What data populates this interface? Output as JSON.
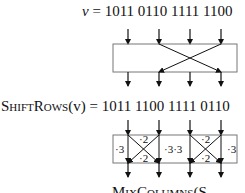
{
  "input": {
    "var": "v",
    "eq": " = ",
    "value": "1011 0110 1111 1100"
  },
  "shiftrows": {
    "func": "ShiftRows",
    "arg": "(v)",
    "eq": " = ",
    "value": "1011 1100 1111 0110"
  },
  "mixcolumns": {
    "func_partial": "MixColumns",
    "arg_partial": "(S"
  },
  "mix_labels": {
    "left_outer": "·3",
    "col1_top": "·2",
    "col1_bottom": "·2",
    "middle": "·3·3",
    "col2_top": "·2",
    "col2_bottom": "·2",
    "right_outer": "·3"
  },
  "colors": {
    "box_stroke": "#777777",
    "arrow": "#111111"
  }
}
